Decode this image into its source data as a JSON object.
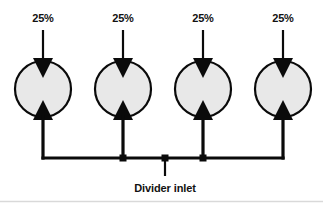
{
  "diagram": {
    "type": "hydraulic-flow-divider-schematic",
    "background_color": "#ffffff",
    "line_color": "#0a0a0a",
    "element_fill_color": "#e8e8e8",
    "inlet": {
      "label": "Divider inlet",
      "label_x": 165,
      "label_y": 190,
      "stub_x": 165,
      "stub_top_y": 158,
      "stub_bottom_y": 176
    },
    "manifold": {
      "y": 158,
      "x_start": 43,
      "x_end": 283,
      "junction_dots": [
        {
          "x": 123,
          "y": 158
        },
        {
          "x": 165,
          "y": 158
        },
        {
          "x": 203,
          "y": 158
        }
      ]
    },
    "elements": [
      {
        "id": "element-1",
        "percent_label": "25%",
        "label_x": 43,
        "label_y": 22,
        "center_x": 43,
        "center_y": 89,
        "radius": 28,
        "inlet_line_top_y": 30,
        "riser_bottom_y": 158
      },
      {
        "id": "element-2",
        "percent_label": "25%",
        "label_x": 123,
        "label_y": 22,
        "center_x": 123,
        "center_y": 89,
        "radius": 28,
        "inlet_line_top_y": 30,
        "riser_bottom_y": 158
      },
      {
        "id": "element-3",
        "percent_label": "25%",
        "label_x": 203,
        "label_y": 22,
        "center_x": 203,
        "center_y": 89,
        "radius": 28,
        "inlet_line_top_y": 30,
        "riser_bottom_y": 158
      },
      {
        "id": "element-4",
        "percent_label": "25%",
        "label_x": 283,
        "label_y": 22,
        "center_x": 283,
        "center_y": 89,
        "radius": 28,
        "inlet_line_top_y": 30,
        "riser_bottom_y": 158
      }
    ]
  }
}
